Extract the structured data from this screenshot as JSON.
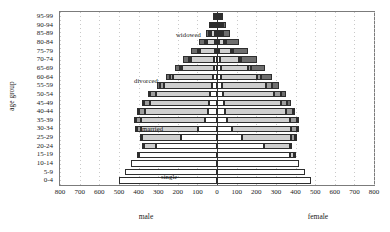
{
  "chart_data": {
    "type": "bar",
    "subtype": "population-pyramid-stacked",
    "title": "",
    "xlabel": "",
    "ylabel": "age group",
    "left_side_label": "male",
    "right_side_label": "female",
    "xlim": [
      -800,
      800
    ],
    "xticks": [
      800,
      700,
      600,
      500,
      400,
      300,
      200,
      100,
      0,
      100,
      200,
      300,
      400,
      500,
      600,
      700,
      800
    ],
    "grid": true,
    "legend_position": "in-plot-annotations",
    "categories": [
      "0-4",
      "5-9",
      "10-14",
      "15-19",
      "20-24",
      "25-29",
      "30-34",
      "35-39",
      "40-44",
      "45-49",
      "50-54",
      "55-59",
      "60-64",
      "65-69",
      "70-74",
      "75-79",
      "80-84",
      "85-89",
      "90-94",
      "95-99"
    ],
    "status_series": [
      {
        "name": "single",
        "color": "#ffffff"
      },
      {
        "name": "married",
        "color": "#cfcfcf"
      },
      {
        "name": "divorced",
        "color": "#9d9d9d"
      },
      {
        "name": "widowed",
        "color": "#6e6e6e"
      }
    ],
    "annotations": [
      {
        "text": "widowed",
        "x_px": 175,
        "y_px": 30
      },
      {
        "text": "divorced",
        "x_px": 133,
        "y_px": 76
      },
      {
        "text": "married",
        "x_px": 141,
        "y_px": 124
      },
      {
        "text": "single",
        "x_px": 160,
        "y_px": 172
      }
    ],
    "male": {
      "0-4": {
        "single": 500,
        "married": 0,
        "divorced": 0,
        "widowed": 0
      },
      "5-9": {
        "single": 470,
        "married": 0,
        "divorced": 0,
        "widowed": 0
      },
      "10-14": {
        "single": 440,
        "married": 0,
        "divorced": 0,
        "widowed": 0
      },
      "15-19": {
        "single": 400,
        "married": 5,
        "divorced": 0,
        "widowed": 0
      },
      "20-24": {
        "single": 310,
        "married": 60,
        "divorced": 5,
        "widowed": 0
      },
      "25-29": {
        "single": 185,
        "married": 195,
        "divorced": 15,
        "widowed": 0
      },
      "30-34": {
        "single": 95,
        "married": 290,
        "divorced": 25,
        "widowed": 2
      },
      "35-39": {
        "single": 60,
        "married": 325,
        "divorced": 30,
        "widowed": 3
      },
      "40-44": {
        "single": 48,
        "married": 320,
        "divorced": 32,
        "widowed": 5
      },
      "45-49": {
        "single": 40,
        "married": 300,
        "divorced": 30,
        "widowed": 7
      },
      "50-54": {
        "single": 34,
        "married": 278,
        "divorced": 27,
        "widowed": 10
      },
      "55-59": {
        "single": 28,
        "married": 242,
        "divorced": 23,
        "widowed": 14
      },
      "60-64": {
        "single": 22,
        "married": 200,
        "divorced": 18,
        "widowed": 20
      },
      "65-69": {
        "single": 17,
        "married": 160,
        "divorced": 13,
        "widowed": 25
      },
      "70-74": {
        "single": 13,
        "married": 118,
        "divorced": 9,
        "widowed": 30
      },
      "75-79": {
        "single": 9,
        "married": 78,
        "divorced": 6,
        "widowed": 32
      },
      "80-84": {
        "single": 6,
        "married": 43,
        "divorced": 3,
        "widowed": 28
      },
      "85-89": {
        "single": 3,
        "married": 18,
        "divorced": 2,
        "widowed": 18
      },
      "90-94": {
        "single": 1,
        "married": 5,
        "divorced": 1,
        "widowed": 8
      },
      "95-99": {
        "single": 0,
        "married": 1,
        "divorced": 0,
        "widowed": 2
      }
    },
    "female": {
      "0-4": {
        "single": 480,
        "married": 0,
        "divorced": 0,
        "widowed": 0
      },
      "5-9": {
        "single": 450,
        "married": 0,
        "divorced": 0,
        "widowed": 0
      },
      "10-14": {
        "single": 420,
        "married": 0,
        "divorced": 0,
        "widowed": 0
      },
      "15-19": {
        "single": 370,
        "married": 20,
        "divorced": 2,
        "widowed": 0
      },
      "20-24": {
        "single": 240,
        "married": 130,
        "divorced": 10,
        "widowed": 0
      },
      "25-29": {
        "single": 125,
        "married": 250,
        "divorced": 22,
        "widowed": 2
      },
      "30-34": {
        "single": 75,
        "married": 300,
        "divorced": 32,
        "widowed": 4
      },
      "35-39": {
        "single": 52,
        "married": 318,
        "divorced": 38,
        "widowed": 7
      },
      "40-44": {
        "single": 42,
        "married": 308,
        "divorced": 38,
        "widowed": 12
      },
      "45-49": {
        "single": 36,
        "married": 288,
        "divorced": 35,
        "widowed": 18
      },
      "50-54": {
        "single": 31,
        "married": 262,
        "divorced": 31,
        "widowed": 28
      },
      "55-59": {
        "single": 26,
        "married": 226,
        "divorced": 26,
        "widowed": 40
      },
      "60-64": {
        "single": 22,
        "married": 182,
        "divorced": 20,
        "widowed": 58
      },
      "65-69": {
        "single": 18,
        "married": 140,
        "divorced": 15,
        "widowed": 72
      },
      "70-74": {
        "single": 15,
        "married": 96,
        "divorced": 11,
        "widowed": 82
      },
      "75-79": {
        "single": 12,
        "married": 58,
        "divorced": 7,
        "widowed": 80
      },
      "80-84": {
        "single": 9,
        "married": 28,
        "divorced": 4,
        "widowed": 62
      },
      "85-89": {
        "single": 5,
        "married": 10,
        "divorced": 2,
        "widowed": 36
      },
      "90-94": {
        "single": 2,
        "married": 3,
        "divorced": 1,
        "widowed": 15
      },
      "95-99": {
        "single": 1,
        "married": 1,
        "divorced": 0,
        "widowed": 4
      }
    }
  }
}
